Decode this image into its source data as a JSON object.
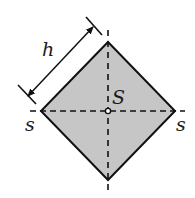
{
  "diagram": {
    "labels": {
      "height": "h",
      "centroid": "S",
      "axis_left": "s",
      "axis_right": "s"
    },
    "shape": {
      "type": "square-rotated-45",
      "fill": "#c6c6c6",
      "stroke": "#111111",
      "vertices": {
        "top": [
          108,
          42
        ],
        "right": [
          175,
          111
        ],
        "bottom": [
          108,
          180
        ],
        "left": [
          41,
          111
        ]
      }
    },
    "centroid_point": [
      108,
      111
    ],
    "dimension": {
      "label": "h",
      "from": [
        30,
        95
      ],
      "to": [
        93,
        27
      ]
    }
  }
}
